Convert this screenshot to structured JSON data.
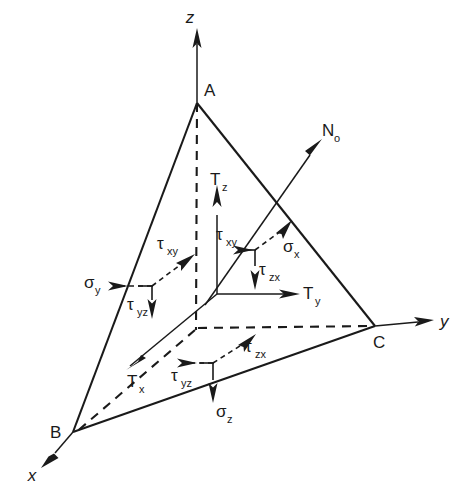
{
  "figure": {
    "background_color": "#ffffff",
    "line_color": "#1a1a1a",
    "width": 463,
    "height": 496
  },
  "axes": [
    {
      "id": "z",
      "label": "z",
      "subscript": "",
      "direction": "up"
    },
    {
      "id": "y",
      "label": "y",
      "subscript": "",
      "direction": "right"
    },
    {
      "id": "x",
      "label": "x",
      "subscript": "",
      "direction": "down-left"
    }
  ],
  "normal": {
    "label": "N",
    "subscript": "o",
    "name": "outward-unit-normal",
    "direction": "up-right"
  },
  "vertices": [
    {
      "id": "A",
      "label": "A",
      "on_axis": "z"
    },
    {
      "id": "B",
      "label": "B",
      "on_axis": "x"
    },
    {
      "id": "C",
      "label": "C",
      "on_axis": "y"
    }
  ],
  "traction_components": [
    {
      "id": "Tz",
      "label": "T",
      "subscript": "z",
      "direction": "up"
    },
    {
      "id": "Ty",
      "label": "T",
      "subscript": "y",
      "direction": "right"
    },
    {
      "id": "Tx",
      "label": "T",
      "subscript": "x",
      "direction": "down-left"
    }
  ],
  "stress_components": [
    {
      "id": "sigma_x",
      "label": "σ",
      "subscript": "x",
      "kind": "normal",
      "direction": "up-right"
    },
    {
      "id": "sigma_y",
      "label": "σ",
      "subscript": "y",
      "kind": "normal",
      "direction": "right"
    },
    {
      "id": "sigma_z",
      "label": "σ",
      "subscript": "z",
      "kind": "normal",
      "direction": "down"
    },
    {
      "id": "tau_xy_upper",
      "label": "τ",
      "subscript": "xy",
      "kind": "shear",
      "direction": "right"
    },
    {
      "id": "tau_xy_left",
      "label": "τ",
      "subscript": "xy",
      "kind": "shear",
      "direction": "up-right"
    },
    {
      "id": "tau_zx_upper",
      "label": "τ",
      "subscript": "zx",
      "kind": "shear",
      "direction": "down"
    },
    {
      "id": "tau_zx_lower",
      "label": "τ",
      "subscript": "zx",
      "kind": "shear",
      "direction": "up-right"
    },
    {
      "id": "tau_yz_left",
      "label": "τ",
      "subscript": "yz",
      "kind": "shear",
      "direction": "down"
    },
    {
      "id": "tau_yz_lower",
      "label": "τ",
      "subscript": "yz",
      "kind": "shear",
      "direction": "right"
    }
  ],
  "labels": {
    "axis_z": "z",
    "axis_y": "y",
    "axis_x": "x",
    "vertex_a": "A",
    "vertex_b": "B",
    "vertex_c": "C",
    "normal_main": "N",
    "normal_sub": "o",
    "t_main": "T",
    "t_sub_z": "z",
    "t_sub_y": "y",
    "t_sub_x": "x",
    "sigma": "σ",
    "sigma_sub_x": "x",
    "sigma_sub_y": "y",
    "sigma_sub_z": "z",
    "tau": "τ",
    "tau_sub_xy": "xy",
    "tau_sub_zx": "zx",
    "tau_sub_yz": "yz"
  }
}
